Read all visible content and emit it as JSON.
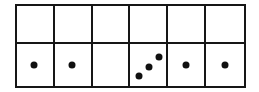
{
  "grid": {
    "type": "dot-counting-table",
    "columns": 6,
    "colors": {
      "border": "#161616",
      "dot": "#101010",
      "background": "#ffffff"
    },
    "rows": [
      {
        "name": "top-row",
        "cells": [
          {
            "dots": []
          },
          {
            "dots": []
          },
          {
            "dots": []
          },
          {
            "dots": []
          },
          {
            "dots": []
          },
          {
            "dots": []
          }
        ]
      },
      {
        "name": "bottom-row",
        "dot_counts": [
          1,
          1,
          0,
          3,
          1,
          1
        ],
        "cells": [
          {
            "dots": [
              {
                "x": 48,
                "y": 49
              }
            ]
          },
          {
            "dots": [
              {
                "x": 48,
                "y": 49
              }
            ]
          },
          {
            "dots": []
          },
          {
            "dots": [
              {
                "x": 23,
                "y": 77
              },
              {
                "x": 53,
                "y": 54
              },
              {
                "x": 79,
                "y": 30
              }
            ]
          },
          {
            "dots": [
              {
                "x": 50,
                "y": 49
              }
            ]
          },
          {
            "dots": [
              {
                "x": 50,
                "y": 49
              }
            ]
          }
        ]
      }
    ]
  }
}
